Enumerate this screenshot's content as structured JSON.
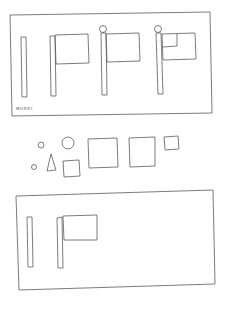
{
  "document": {
    "type": "scanned worksheet",
    "model_label": "MODEL",
    "colors": {
      "ink": "#5a5a5a",
      "paper": "#ffffff"
    }
  },
  "model_panel": {
    "label": "MODEL",
    "steps": [
      {
        "name": "pole",
        "parts": [
          "pole"
        ]
      },
      {
        "name": "pole-with-flag",
        "parts": [
          "pole",
          "flag"
        ]
      },
      {
        "name": "pole-with-flag-and-knob",
        "parts": [
          "pole",
          "flag",
          "knob"
        ]
      },
      {
        "name": "pole-with-flag-knob-and-canton",
        "parts": [
          "pole",
          "flag",
          "knob",
          "canton-square"
        ]
      }
    ]
  },
  "loose_pieces": [
    {
      "shape": "circle",
      "size": "small"
    },
    {
      "shape": "circle",
      "size": "medium"
    },
    {
      "shape": "circle",
      "size": "tiny"
    },
    {
      "shape": "triangle",
      "size": "small"
    },
    {
      "shape": "square",
      "size": "small"
    },
    {
      "shape": "square",
      "size": "large"
    },
    {
      "shape": "square",
      "size": "large"
    },
    {
      "shape": "square",
      "size": "small"
    }
  ],
  "response_panel": {
    "steps": [
      {
        "name": "pole",
        "parts": [
          "pole"
        ]
      },
      {
        "name": "pole-with-flag",
        "parts": [
          "pole",
          "flag"
        ]
      }
    ]
  }
}
